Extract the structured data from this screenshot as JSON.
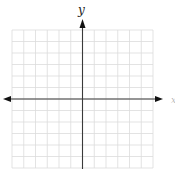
{
  "diagram": {
    "type": "coordinate-plane",
    "axes": {
      "x_label": "x",
      "y_label": "y",
      "arrows": [
        "left",
        "right",
        "up"
      ],
      "axis_color": "#3a3a3a"
    },
    "grid": {
      "columns": 12,
      "rows": 12,
      "line_color": "#dcdcdc",
      "origin_column": 6,
      "origin_row": 6
    },
    "colors": {
      "background": "#ffffff",
      "axis": "#3a3a3a",
      "grid": "#dcdcdc",
      "label": "#222222"
    }
  }
}
